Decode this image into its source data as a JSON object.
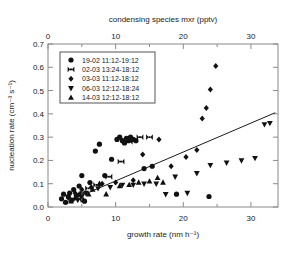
{
  "chart_data": {
    "type": "scatter",
    "title": "",
    "xlabel": "growth rate (nm h⁻¹)",
    "ylabel": "nucleation rate (cm⁻³ s⁻¹)",
    "x2label": "condensing species mxr (pptv)",
    "xlim": [
      0,
      34
    ],
    "ylim": [
      0.0,
      0.7
    ],
    "x2lim": [
      0,
      34
    ],
    "xticks": [
      0,
      10,
      20,
      30
    ],
    "yticks": [
      "0.0",
      "0.1",
      "0.2",
      "0.3",
      "0.4",
      "0.5",
      "0.6",
      "0.7"
    ],
    "x2ticks": [
      0,
      10,
      20,
      30
    ],
    "xminorticks": [
      5,
      15,
      25
    ],
    "grid": false,
    "legend_position": "upper-left",
    "trendline": {
      "x0": 2.2,
      "y0": 0.015,
      "x1": 33.6,
      "y1": 0.405
    },
    "series": [
      {
        "name": "19-02  11:12-19:12",
        "marker": "circle",
        "points": [
          [
            2.0,
            0.035
          ],
          [
            2.3,
            0.055
          ],
          [
            2.6,
            0.02
          ],
          [
            3.0,
            0.045
          ],
          [
            3.2,
            0.06
          ],
          [
            3.5,
            0.03
          ],
          [
            3.8,
            0.075
          ],
          [
            4.2,
            0.05
          ],
          [
            4.6,
            0.09
          ],
          [
            5.0,
            0.135
          ],
          [
            5.4,
            0.025
          ],
          [
            6.2,
            0.105
          ],
          [
            7.0,
            0.24
          ],
          [
            7.6,
            0.27
          ],
          [
            8.4,
            0.135
          ],
          [
            9.4,
            0.205
          ],
          [
            10.2,
            0.29
          ],
          [
            10.6,
            0.3
          ],
          [
            11.0,
            0.285
          ],
          [
            11.3,
            0.275
          ],
          [
            11.6,
            0.295
          ],
          [
            11.9,
            0.285
          ],
          [
            12.2,
            0.3
          ],
          [
            12.6,
            0.29
          ],
          [
            13.0,
            0.285
          ],
          [
            14.2,
            0.165
          ],
          [
            15.4,
            0.175
          ],
          [
            19.0,
            0.055
          ],
          [
            23.8,
            0.045
          ]
        ]
      },
      {
        "name": "02-03  13:24-18:12",
        "marker": "bowtie",
        "points": [
          [
            4.4,
            0.035
          ],
          [
            5.2,
            0.06
          ],
          [
            6.0,
            0.08
          ],
          [
            7.2,
            0.095
          ],
          [
            9.0,
            0.13
          ],
          [
            10.8,
            0.195
          ],
          [
            12.0,
            0.28
          ],
          [
            13.6,
            0.3
          ],
          [
            15.0,
            0.3
          ]
        ]
      },
      {
        "name": "03-03  11:12-18:12",
        "marker": "diamond",
        "points": [
          [
            3.0,
            0.04
          ],
          [
            4.0,
            0.06
          ],
          [
            5.0,
            0.075
          ],
          [
            6.4,
            0.085
          ],
          [
            8.0,
            0.1
          ],
          [
            10.0,
            0.105
          ],
          [
            12.6,
            0.115
          ],
          [
            14.0,
            0.225
          ],
          [
            16.4,
            0.29
          ],
          [
            18.2,
            0.175
          ],
          [
            20.4,
            0.215
          ],
          [
            22.0,
            0.245
          ],
          [
            22.8,
            0.38
          ],
          [
            23.4,
            0.425
          ],
          [
            24.0,
            0.505
          ],
          [
            24.8,
            0.605
          ]
        ]
      },
      {
        "name": "06-03  12:12-18:24",
        "marker": "triangle-down",
        "points": [
          [
            4.4,
            0.03
          ],
          [
            5.0,
            0.045
          ],
          [
            5.6,
            0.06
          ],
          [
            7.4,
            0.08
          ],
          [
            9.2,
            0.085
          ],
          [
            11.0,
            0.095
          ],
          [
            12.6,
            0.095
          ],
          [
            14.2,
            0.1
          ],
          [
            16.0,
            0.1
          ],
          [
            17.4,
            0.055
          ],
          [
            18.8,
            0.13
          ],
          [
            20.6,
            0.06
          ],
          [
            22.0,
            0.145
          ],
          [
            24.0,
            0.18
          ],
          [
            26.4,
            0.19
          ],
          [
            28.6,
            0.2
          ],
          [
            30.6,
            0.21
          ],
          [
            32.0,
            0.355
          ],
          [
            32.8,
            0.36
          ]
        ]
      },
      {
        "name": "14-03  12:12-18:12",
        "marker": "triangle-up",
        "points": [
          [
            3.4,
            0.025
          ],
          [
            4.0,
            0.04
          ],
          [
            4.6,
            0.055
          ],
          [
            5.2,
            0.03
          ],
          [
            6.0,
            0.055
          ],
          [
            6.6,
            0.075
          ],
          [
            7.6,
            0.1
          ],
          [
            8.6,
            0.055
          ],
          [
            10.6,
            0.09
          ],
          [
            12.0,
            0.095
          ],
          [
            13.4,
            0.105
          ],
          [
            15.0,
            0.11
          ],
          [
            16.2,
            0.125
          ],
          [
            17.0,
            0.105
          ]
        ]
      }
    ]
  },
  "legend": {
    "entries": [
      {
        "label": "19-02  11:12-19:12",
        "marker": "circle"
      },
      {
        "label": "02-03  13:24-18:12",
        "marker": "bowtie"
      },
      {
        "label": "03-03  11:12-18:12",
        "marker": "diamond"
      },
      {
        "label": "06-03  12:12-18:24",
        "marker": "triangle-down"
      },
      {
        "label": "14-03  12:12-18:12",
        "marker": "triangle-up"
      }
    ]
  },
  "axes": {
    "bottom_title": "growth rate (nm h⁻¹)",
    "left_title": "nucleation rate (cm⁻³ s⁻¹)",
    "top_title": "condensing species mxr (pptv)"
  }
}
